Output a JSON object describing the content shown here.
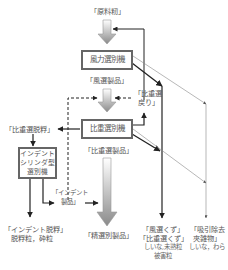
{
  "diagram": {
    "input": "「原料籾」",
    "machines": {
      "wind": "風力選別機",
      "gravity": "比重選別機",
      "indent_line1": "インデント",
      "indent_line2": "シリンダ型",
      "indent_line3": "選別機"
    },
    "products": {
      "wind_product": "「風選製品」",
      "gravity_return_line1": "「比重選",
      "gravity_return_line2": "戻り」",
      "gravity_product": "「比重選製品」",
      "gravity_hulled": "「比重選脱粰」",
      "indent_product_line1": "「インデント",
      "indent_product_line2": "製品」",
      "final_product": "「精選別製品」"
    },
    "outputs": {
      "indent_hulled_line1": "「インデント脱粰」",
      "indent_hulled_line2": "脱粰粒，砕粒",
      "waste_line1": "「風選くず」",
      "waste_line2": "「比重選くず」",
      "waste_line3": "しいな,未熟粒",
      "waste_line4": "被害粒",
      "suction_line1": "「吸引除去",
      "suction_line2": "夾雑物」",
      "suction_line3": "しいな，わら"
    },
    "colors": {
      "line": "#222222",
      "thin_line": "#888888",
      "box_border": "#666666",
      "gradient_arrow_top": "#ffffff",
      "gradient_arrow_bottom": "#8a8a8a"
    }
  }
}
